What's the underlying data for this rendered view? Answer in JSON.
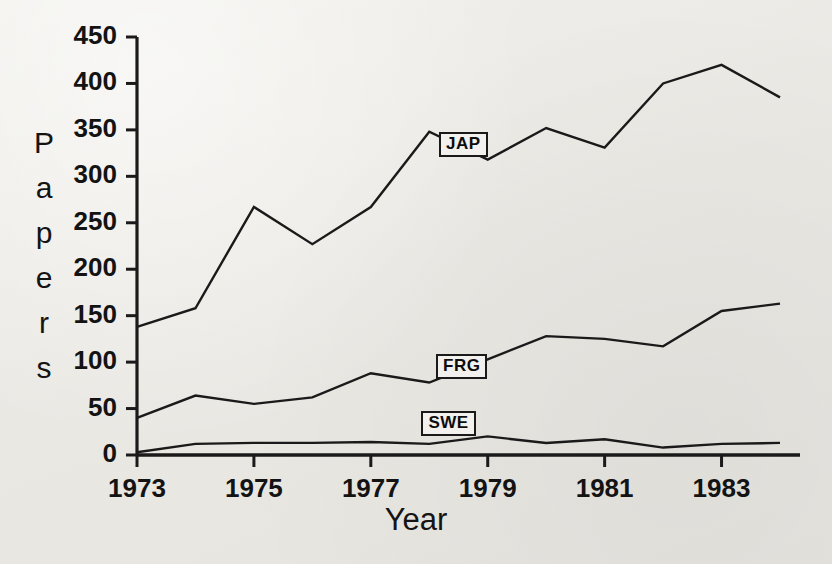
{
  "figure": {
    "background_color": "#ebeae6",
    "ink_color": "#1a1a1a"
  },
  "axis": {
    "y_title_letters": [
      "P",
      "a",
      "p",
      "e",
      "r",
      "s"
    ],
    "y_title": "Papers",
    "x_title": "Year"
  },
  "chart_data": {
    "type": "line",
    "title": "",
    "xlabel": "Year",
    "ylabel": "Papers",
    "xlim": [
      1973,
      1984
    ],
    "ylim": [
      0,
      450
    ],
    "ytick_values": [
      0,
      50,
      100,
      150,
      200,
      250,
      300,
      350,
      400,
      450
    ],
    "ytick_labels": [
      "0",
      "50",
      "100",
      "150",
      "200",
      "250",
      "300",
      "350",
      "400",
      "450"
    ],
    "xtick_values": [
      1973,
      1975,
      1977,
      1979,
      1981,
      1983
    ],
    "xtick_labels": [
      "1973",
      "1975",
      "1977",
      "1979",
      "1981",
      "1983"
    ],
    "x": [
      1973,
      1974,
      1975,
      1976,
      1977,
      1978,
      1979,
      1980,
      1981,
      1982,
      1983,
      1984
    ],
    "grid": false,
    "legend_position": "inline-labels",
    "series": [
      {
        "name": "JAP",
        "label": "JAP",
        "color": "#1a1a1a",
        "values": [
          138,
          158,
          267,
          227,
          267,
          348,
          318,
          352,
          331,
          400,
          420,
          385
        ],
        "label_x": 1978.2,
        "label_y": 335
      },
      {
        "name": "FRG",
        "label": "FRG",
        "color": "#1a1a1a",
        "values": [
          40,
          64,
          55,
          62,
          88,
          78,
          103,
          128,
          125,
          117,
          155,
          163
        ],
        "label_x": 1978.15,
        "label_y": 96
      },
      {
        "name": "SWE",
        "label": "SWE",
        "color": "#1a1a1a",
        "values": [
          3,
          12,
          13,
          13,
          14,
          12,
          20,
          13,
          17,
          8,
          12,
          13
        ],
        "label_x": 1977.9,
        "label_y": 34
      }
    ]
  }
}
